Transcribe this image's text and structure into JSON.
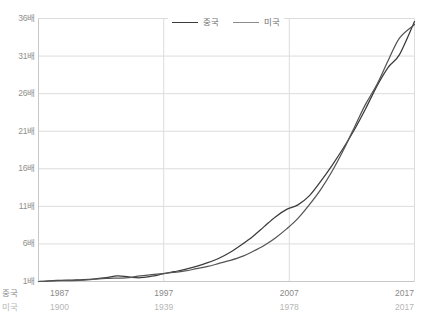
{
  "chart_data": {
    "type": "line",
    "title": "",
    "xlabel": "",
    "ylabel": "",
    "grid": true,
    "legend_position": "top-center",
    "ylim": [
      1,
      36
    ],
    "yticks": [
      1,
      6,
      11,
      16,
      21,
      26,
      31,
      36
    ],
    "ytick_labels": [
      "1배",
      "6배",
      "11배",
      "16배",
      "21배",
      "26배",
      "31배",
      "36배"
    ],
    "xaxes": [
      {
        "name": "중국",
        "prefix": "중국",
        "tick_labels": [
          "1987",
          "1997",
          "2007",
          "2017"
        ],
        "tick_positions": [
          0,
          33.3,
          66.7,
          100
        ]
      },
      {
        "name": "미국",
        "prefix": "미국",
        "tick_labels": [
          "1900",
          "1939",
          "1978",
          "2017"
        ],
        "tick_positions": [
          0,
          33.3,
          66.7,
          100
        ]
      }
    ],
    "series": [
      {
        "name": "중국",
        "color": "#3b3b3b",
        "x": [
          0,
          3,
          6,
          9,
          12,
          15,
          18,
          21,
          24,
          27,
          30,
          33,
          36,
          39,
          42,
          45,
          48,
          51,
          54,
          57,
          60,
          63,
          66,
          69,
          72,
          75,
          78,
          81,
          84,
          87,
          90,
          93,
          96,
          100
        ],
        "values": [
          1.0,
          1.1,
          1.15,
          1.2,
          1.25,
          1.35,
          1.5,
          1.75,
          1.6,
          1.5,
          1.7,
          2.0,
          2.3,
          2.6,
          3.0,
          3.5,
          4.1,
          4.9,
          5.9,
          7.0,
          8.3,
          9.6,
          10.6,
          11.2,
          12.4,
          14.3,
          16.4,
          18.7,
          21.2,
          24.0,
          27.0,
          29.5,
          31.2,
          35.6
        ]
      },
      {
        "name": "미국",
        "color": "#555555",
        "x": [
          0,
          3,
          6,
          9,
          12,
          15,
          18,
          21,
          24,
          27,
          30,
          33,
          36,
          39,
          42,
          45,
          48,
          51,
          54,
          57,
          60,
          63,
          66,
          69,
          72,
          75,
          78,
          81,
          84,
          87,
          90,
          93,
          96,
          100
        ],
        "values": [
          1.0,
          1.05,
          1.1,
          1.12,
          1.18,
          1.3,
          1.4,
          1.45,
          1.5,
          1.75,
          1.9,
          2.05,
          2.2,
          2.4,
          2.7,
          3.0,
          3.4,
          3.8,
          4.3,
          5.0,
          5.8,
          6.8,
          8.0,
          9.4,
          11.2,
          13.2,
          15.6,
          18.4,
          21.5,
          24.6,
          27.2,
          30.4,
          33.4,
          35.2
        ]
      }
    ]
  },
  "legend": {
    "items": [
      {
        "label": "중국",
        "color": "#3b3b3b"
      },
      {
        "label": "미국",
        "color": "#8a8a8a"
      }
    ]
  },
  "colors": {
    "china_line": "#3b3b3b",
    "usa_line": "#555555",
    "grid": "#dcdcdc",
    "axis": "#c8c8c8",
    "tick_text": "#8a8a8a",
    "tick_text_secondary": "#b6b6b6"
  }
}
